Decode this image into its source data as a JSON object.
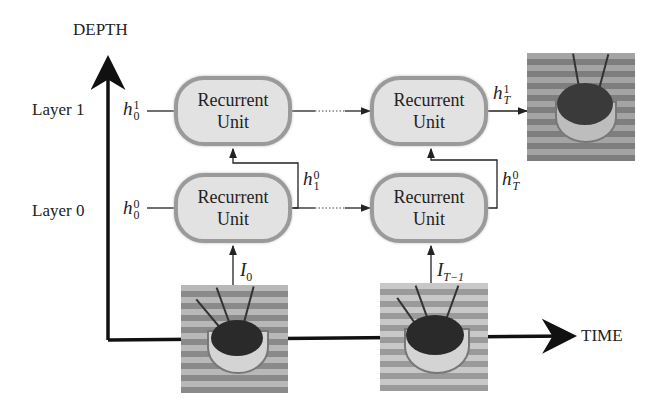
{
  "axes": {
    "depth_label": "DEPTH",
    "time_label": "TIME"
  },
  "layers": [
    {
      "label": "Layer 1",
      "initial_state": {
        "base": "h",
        "sub": "0",
        "sup": "1"
      }
    },
    {
      "label": "Layer 0",
      "initial_state": {
        "base": "h",
        "sub": "0",
        "sup": "0"
      }
    }
  ],
  "units": [
    {
      "line1": "Recurrent",
      "line2": "Unit"
    },
    {
      "line1": "Recurrent",
      "line2": "Unit"
    },
    {
      "line1": "Recurrent",
      "line2": "Unit"
    },
    {
      "line1": "Recurrent",
      "line2": "Unit"
    }
  ],
  "states": {
    "h_1_0": {
      "base": "h",
      "sub": "1",
      "sup": "0"
    },
    "h_T_0": {
      "base": "h",
      "sub": "T",
      "sup": "0"
    },
    "h_T_1": {
      "base": "h",
      "sub": "T",
      "sup": "1"
    }
  },
  "inputs": [
    {
      "base": "I",
      "sub": "0"
    },
    {
      "base": "I",
      "sub": "T−1"
    }
  ],
  "images": [
    "input-frame-0",
    "input-frame-T-1",
    "predicted-frame-T"
  ]
}
